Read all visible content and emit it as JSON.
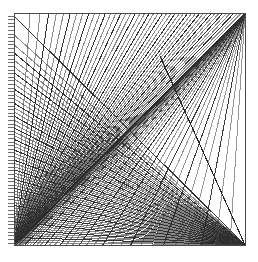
{
  "figure": {
    "type": "geometric-line-envelope",
    "canvas": {
      "width": 258,
      "height": 262,
      "background": "#ffffff"
    },
    "frame": {
      "left": 14,
      "top": 13,
      "right": 245,
      "bottom": 245,
      "stroke": "#4a4a4a",
      "stroke_width": 1
    },
    "colors": {
      "line": "#3c3c3c",
      "line_light": "#6e6e6e",
      "line_dark": "#262626",
      "frame": "#4a4a4a",
      "tick": "#555555",
      "background": "#ffffff"
    },
    "axis_ticks": {
      "edge": "left",
      "count": 64,
      "length": 6,
      "x_outer": 8,
      "x_inner": 14,
      "y_start": 16,
      "y_end": 243,
      "stroke": "#555555"
    },
    "families": [
      {
        "name": "horizontal-fan-to-bottom-right",
        "description": "Segments from the left frame edge to the bottom-right corner, spacing compressed toward the bottom",
        "count": 58,
        "anchor_x": 245,
        "anchor_y": 245,
        "source_edge": "left",
        "source_x": 14,
        "source_y_start": 16,
        "source_y_end": 245,
        "stroke_width": 1.0
      },
      {
        "name": "vertical-fan-to-bottom-left",
        "description": "Segments from the top frame edge to the bottom-left corner, forming the upper-left crosshatch grid",
        "count": 46,
        "anchor_x": 14,
        "anchor_y": 245,
        "source_edge": "top",
        "source_x_start": 14,
        "source_x_end": 245,
        "source_y": 13,
        "stroke_width": 1.0
      },
      {
        "name": "vertical-fan-to-top-right",
        "description": "Dense vertical band near the right edge converging at the top-right corner",
        "count": 40,
        "anchor_x": 245,
        "anchor_y": 13,
        "source_edge": "bottom",
        "source_x_start": 14,
        "source_x_end": 245,
        "source_y": 245,
        "stroke_width": 1.0
      }
    ],
    "diagonals": [
      {
        "name": "diagonal-bottom-left-to-top-right",
        "x1": 14,
        "y1": 245,
        "x2": 245,
        "y2": 13
      },
      {
        "name": "diagonal-top-right-to-bottom-right",
        "x1": 160,
        "y1": 56,
        "x2": 245,
        "y2": 245
      }
    ],
    "envelope": {
      "name": "parabolic-arc-envelope",
      "description": "Curved boundary formed by the intersection of the line families, rising from the bottom-left corner over the top and descending to the right",
      "apex_x": 128,
      "apex_y": 17,
      "start_x": 14,
      "start_y": 245,
      "end_x": 245,
      "end_y": 245
    }
  }
}
